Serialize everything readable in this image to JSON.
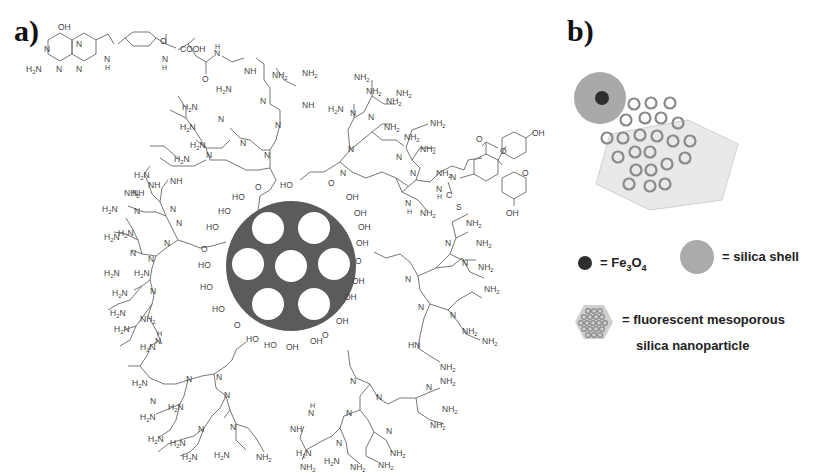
{
  "figure": {
    "panel_a": {
      "label": "a)",
      "core": {
        "description": "mesoporous silica nanoparticle core with 7 pores",
        "fill_color": "#5a5a5a",
        "pore_count": 7,
        "surface_groups": "OH",
        "linker_atom": "O"
      },
      "folate_moiety": {
        "labels": [
          "OH",
          "N",
          "N",
          "N",
          "N",
          "H2N",
          "N",
          "H",
          "O",
          "COOH",
          "N",
          "H",
          "O",
          "N",
          "H"
        ],
        "carboxyl": "COOH",
        "amine": "H2N"
      },
      "fluorescein_moiety": {
        "labels": [
          "O",
          "O",
          "OH",
          "O",
          "OH",
          "N",
          "C",
          "S",
          "N",
          "H"
        ],
        "thiourea": "S"
      },
      "dendrimer_labels": {
        "amine_terminal": "NH2",
        "amine_terminal_alt": "H2N",
        "branch_node": "N",
        "secondary_amine": "NH",
        "secondary_amine_alt": "HN"
      }
    },
    "panel_b": {
      "label": "b)",
      "schematic": {
        "shell_color": "#aaaaaa",
        "core_color": "#333333",
        "hexagon_color": "#e6e6e6",
        "pore_ring_color": "#888888",
        "pore_count": 22
      },
      "legend": [
        {
          "symbol": "fe3o4-dot",
          "text_prefix": "= Fe",
          "sub1": "3",
          "mid": "O",
          "sub2": "4"
        },
        {
          "symbol": "silica-shell-disk",
          "text": "= silica shell"
        },
        {
          "symbol": "mesoporous-hexagon",
          "text_line1": "= fluorescent mesoporous",
          "text_line2": "silica nanoparticle"
        }
      ]
    }
  }
}
